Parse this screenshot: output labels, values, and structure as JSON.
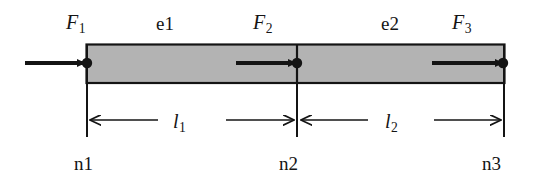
{
  "figure": {
    "colors": {
      "bar_fill": "#b3b3b3",
      "stroke": "#141414",
      "background": "#ffffff"
    },
    "bar": {
      "left": 86,
      "right": 505,
      "top": 44,
      "bottom": 83,
      "divider_x": 297
    }
  },
  "force_labels": [
    {
      "name": "F1",
      "base": "F",
      "subscript": "1",
      "x": 66,
      "y": 12
    },
    {
      "name": "F2",
      "base": "F",
      "subscript": "2",
      "x": 253,
      "y": 12
    },
    {
      "name": "F3",
      "base": "F",
      "subscript": "3",
      "x": 452,
      "y": 12
    }
  ],
  "element_labels": [
    {
      "name": "e1",
      "text": "e1",
      "x": 156,
      "y": 14
    },
    {
      "name": "e2",
      "text": "e2",
      "x": 381,
      "y": 14
    }
  ],
  "length_labels": [
    {
      "name": "l1",
      "base": "l",
      "subscript": "1",
      "x": 173,
      "y": 113
    },
    {
      "name": "l2",
      "base": "l",
      "subscript": "2",
      "x": 385,
      "y": 113
    }
  ],
  "node_labels": [
    {
      "name": "n1",
      "text": "n1",
      "x": 74,
      "y": 154
    },
    {
      "name": "n2",
      "text": "n2",
      "x": 279,
      "y": 154
    },
    {
      "name": "n3",
      "text": "n3",
      "x": 482,
      "y": 154
    }
  ],
  "force_arrows": [
    {
      "name": "force-arrow-1",
      "x1": 25,
      "x2": 86,
      "y": 63
    },
    {
      "name": "force-arrow-2",
      "x1": 236,
      "x2": 297,
      "y": 63
    },
    {
      "name": "force-arrow-3",
      "x1": 432,
      "x2": 505,
      "y": 63
    }
  ],
  "nodes": [
    {
      "name": "node-dot-n1",
      "cx": 87,
      "cy": 63
    },
    {
      "name": "node-dot-n2",
      "cx": 297,
      "cy": 63
    },
    {
      "name": "node-dot-n3",
      "cx": 504,
      "cy": 63
    }
  ],
  "extension_lines": [
    {
      "name": "extension-line-n1",
      "x": 87,
      "y1": 44,
      "y2": 137
    },
    {
      "name": "extension-line-n2",
      "x": 297,
      "y1": 44,
      "y2": 137
    },
    {
      "name": "extension-line-n3",
      "x": 504,
      "y1": 44,
      "y2": 137
    }
  ],
  "dimension_lines": [
    {
      "name": "dimension-l1-left",
      "from": 155,
      "to": 88,
      "y": 120
    },
    {
      "name": "dimension-l1-right",
      "from": 228,
      "to": 296,
      "y": 120
    },
    {
      "name": "dimension-l2-left",
      "from": 365,
      "to": 299,
      "y": 120
    },
    {
      "name": "dimension-l2-right",
      "from": 435,
      "to": 503,
      "y": 120
    }
  ]
}
